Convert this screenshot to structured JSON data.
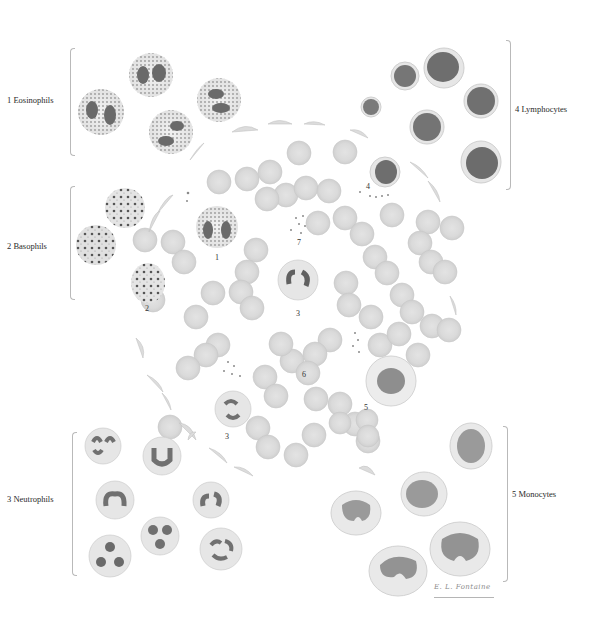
{
  "plate": {
    "groups": [
      {
        "id": "eosinophils",
        "number": "1",
        "label": "1  Eosinophils",
        "side": "left"
      },
      {
        "id": "basophils",
        "number": "2",
        "label": "2  Basophils",
        "side": "left"
      },
      {
        "id": "neutrophils",
        "number": "3",
        "label": "3  Neutrophils",
        "side": "left"
      },
      {
        "id": "lymphocytes",
        "number": "4",
        "label": "4  Lymphocytes",
        "side": "right"
      },
      {
        "id": "monocytes",
        "number": "5",
        "label": "5  Monocytes",
        "side": "right"
      }
    ],
    "smear_numbers": [
      "1",
      "2",
      "3",
      "3",
      "4",
      "5",
      "6",
      "7"
    ],
    "signature": "E. L. Fontaine",
    "colors": {
      "background": "#ffffff",
      "rbc_fill": "#d9d9d9",
      "rbc_edge": "#c4c4c4",
      "nucleus_dark": "#5e5e5e",
      "nucleus_mid": "#8a8a8a",
      "cytoplasm": "#ececec",
      "granule": "#777777",
      "bracket": "#b9b9b9",
      "text": "#2a2a2a"
    }
  }
}
